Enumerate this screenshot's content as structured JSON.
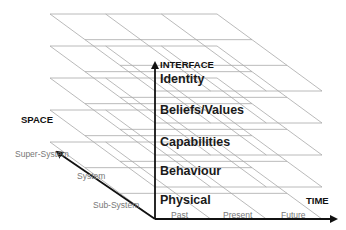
{
  "diagram": {
    "vertical_axis": {
      "title": "INTERFACE"
    },
    "space_axis": {
      "title": "SPACE",
      "levels": [
        "Sub-System",
        "System",
        "Super-System"
      ]
    },
    "time_axis": {
      "title": "TIME",
      "levels": [
        "Past",
        "Present",
        "Future"
      ]
    },
    "layers": [
      {
        "label": "Identity"
      },
      {
        "label": "Beliefs/Values"
      },
      {
        "label": "Capabilities"
      },
      {
        "label": "Behaviour"
      },
      {
        "label": "Physical"
      }
    ],
    "colors": {
      "grid": "#a8a8a8",
      "axis": "#111111",
      "text": "#1a1a1a",
      "tick_text": "#777777"
    }
  },
  "geometry": {
    "layer_back_y": [
      14,
      46,
      78,
      110,
      142
    ],
    "depth_y": 77,
    "back_left_x": 50,
    "front_left_x": 155,
    "layer_width": 167,
    "time_divisions": 3,
    "space_divisions": 3
  }
}
